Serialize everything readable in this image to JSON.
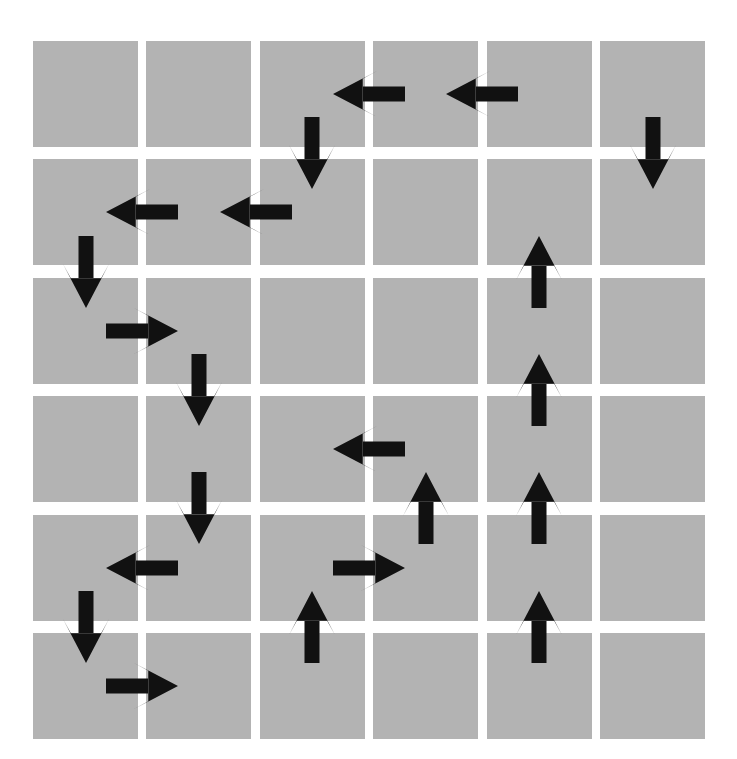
{
  "figure": {
    "background_color": "#ffffff",
    "cell_color": "#b3b3b3",
    "arrow_color": "#111111"
  },
  "grid": {
    "rows": 6,
    "cols": 6,
    "origin_x": 33,
    "origin_y": 41,
    "cell_width": 105,
    "cell_height": 106,
    "pitch_x": 113.4,
    "pitch_y": 118.4
  },
  "arrows": [
    {
      "name": "arrow-r0-c2c3-left",
      "direction": "left",
      "orientation": "horizontal",
      "row": 0,
      "col": 2,
      "edge": "right",
      "glyph": "←"
    },
    {
      "name": "arrow-r0-c3c4-left",
      "direction": "left",
      "orientation": "horizontal",
      "row": 0,
      "col": 3,
      "edge": "right",
      "glyph": "←"
    },
    {
      "name": "arrow-r0r1-c2-down",
      "direction": "down",
      "orientation": "vertical",
      "row": 0,
      "col": 2,
      "edge": "bottom",
      "glyph": "↓"
    },
    {
      "name": "arrow-r0r1-c5-down",
      "direction": "down",
      "orientation": "vertical",
      "row": 0,
      "col": 5,
      "edge": "bottom",
      "glyph": "↓"
    },
    {
      "name": "arrow-r1-c0c1-left",
      "direction": "left",
      "orientation": "horizontal",
      "row": 1,
      "col": 0,
      "edge": "right",
      "glyph": "←"
    },
    {
      "name": "arrow-r1-c1c2-left",
      "direction": "left",
      "orientation": "horizontal",
      "row": 1,
      "col": 1,
      "edge": "right",
      "glyph": "←"
    },
    {
      "name": "arrow-r1r2-c0-down",
      "direction": "down",
      "orientation": "vertical",
      "row": 1,
      "col": 0,
      "edge": "bottom",
      "glyph": "↓"
    },
    {
      "name": "arrow-r1r2-c4-up",
      "direction": "up",
      "orientation": "vertical",
      "row": 1,
      "col": 4,
      "edge": "bottom",
      "glyph": "↑"
    },
    {
      "name": "arrow-r2-c0c1-right",
      "direction": "right",
      "orientation": "horizontal",
      "row": 2,
      "col": 0,
      "edge": "right",
      "glyph": "→"
    },
    {
      "name": "arrow-r2r3-c1-down",
      "direction": "down",
      "orientation": "vertical",
      "row": 2,
      "col": 1,
      "edge": "bottom",
      "glyph": "↓"
    },
    {
      "name": "arrow-r2r3-c4-up",
      "direction": "up",
      "orientation": "vertical",
      "row": 2,
      "col": 4,
      "edge": "bottom",
      "glyph": "↑"
    },
    {
      "name": "arrow-r3-c2c3-left",
      "direction": "left",
      "orientation": "horizontal",
      "row": 3,
      "col": 2,
      "edge": "right",
      "glyph": "←"
    },
    {
      "name": "arrow-r3r4-c1-down",
      "direction": "down",
      "orientation": "vertical",
      "row": 3,
      "col": 1,
      "edge": "bottom",
      "glyph": "↓"
    },
    {
      "name": "arrow-r3r4-c3-up",
      "direction": "up",
      "orientation": "vertical",
      "row": 3,
      "col": 3,
      "edge": "bottom",
      "glyph": "↑"
    },
    {
      "name": "arrow-r3r4-c4-up",
      "direction": "up",
      "orientation": "vertical",
      "row": 3,
      "col": 4,
      "edge": "bottom",
      "glyph": "↑"
    },
    {
      "name": "arrow-r4-c0c1-left",
      "direction": "left",
      "orientation": "horizontal",
      "row": 4,
      "col": 0,
      "edge": "right",
      "glyph": "←"
    },
    {
      "name": "arrow-r4-c2c3-right",
      "direction": "right",
      "orientation": "horizontal",
      "row": 4,
      "col": 2,
      "edge": "right",
      "glyph": "→"
    },
    {
      "name": "arrow-r4r5-c0-down",
      "direction": "down",
      "orientation": "vertical",
      "row": 4,
      "col": 0,
      "edge": "bottom",
      "glyph": "↓"
    },
    {
      "name": "arrow-r4r5-c2-up",
      "direction": "up",
      "orientation": "vertical",
      "row": 4,
      "col": 2,
      "edge": "bottom",
      "glyph": "↑"
    },
    {
      "name": "arrow-r4r5-c4-up",
      "direction": "up",
      "orientation": "vertical",
      "row": 4,
      "col": 4,
      "edge": "bottom",
      "glyph": "↑"
    },
    {
      "name": "arrow-r5-c0c1-right",
      "direction": "right",
      "orientation": "horizontal",
      "row": 5,
      "col": 0,
      "edge": "right",
      "glyph": "→"
    }
  ],
  "arrow_style": {
    "length": 72,
    "shaft_thickness": 15,
    "head_width": 46,
    "head_length": 34
  }
}
